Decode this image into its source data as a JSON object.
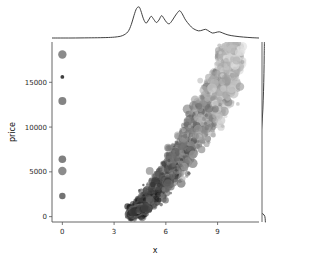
{
  "figure": {
    "type": "jointplot",
    "background": "#ffffff",
    "width": 312,
    "height": 264
  },
  "axes": {
    "x": {
      "label": "x",
      "ticks": [
        0,
        3,
        6,
        9
      ],
      "tick_labels": [
        "0",
        "3",
        "6",
        "9"
      ],
      "range": [
        -0.6,
        11.4
      ]
    },
    "y": {
      "label": "price",
      "ticks": [
        0,
        5000,
        10000,
        15000
      ],
      "tick_labels": [
        "0",
        "5000",
        "10000",
        "15000"
      ],
      "range": [
        -600,
        19500
      ]
    }
  },
  "chart_data": {
    "type": "scatter",
    "title": "",
    "xlabel": "x",
    "ylabel": "price",
    "xlim": [
      -0.6,
      11.4
    ],
    "ylim": [
      -600,
      19500
    ],
    "grid": false,
    "legend": null,
    "marker_encoding": {
      "size_varies": true,
      "color_varies": true,
      "colormap": "grayscale",
      "note": "marker grayscale ranges dark (#1a1a1a) to light (#d9d9d9); marker radius 1 to 5 px"
    },
    "outlier_points_at_x0": {
      "x": [
        0,
        0,
        0,
        0,
        0,
        0
      ],
      "y": [
        18100,
        15600,
        12900,
        6400,
        5100,
        2300
      ],
      "sizes": [
        4.2,
        1.9,
        4.0,
        3.8,
        4.2,
        3.2
      ],
      "colors": [
        "#777777",
        "#1f1f1f",
        "#6e6e6e",
        "#6a6a6a",
        "#787878",
        "#5a5a5a"
      ]
    },
    "main_cloud": {
      "description": "dense curved band rising from (x~4.0, price~400) to (x~10.3, price~18800)",
      "x_range": [
        3.6,
        10.6
      ],
      "y_range": [
        300,
        19000
      ],
      "n_points_approx": 2600,
      "trend": "monotonic increasing, convex; spread widens with x"
    },
    "marginal_top": {
      "type": "line",
      "orientation": "horizontal-kde",
      "xlabel": "x",
      "x": [
        -0.6,
        0.5,
        1.5,
        2.2,
        2.8,
        3.2,
        3.5,
        3.8,
        4.0,
        4.15,
        4.3,
        4.45,
        4.55,
        4.7,
        4.85,
        5.0,
        5.15,
        5.3,
        5.45,
        5.6,
        5.75,
        5.9,
        6.05,
        6.2,
        6.35,
        6.5,
        6.65,
        6.8,
        6.95,
        7.1,
        7.25,
        7.4,
        7.55,
        7.7,
        7.9,
        8.1,
        8.3,
        8.5,
        8.7,
        8.9,
        9.1,
        9.3,
        9.6,
        10.0,
        10.5,
        11.0,
        11.4
      ],
      "density": [
        0.0,
        0.0,
        0.005,
        0.01,
        0.02,
        0.04,
        0.08,
        0.2,
        0.44,
        0.72,
        0.95,
        1.0,
        0.88,
        0.62,
        0.48,
        0.58,
        0.7,
        0.6,
        0.5,
        0.58,
        0.72,
        0.62,
        0.5,
        0.46,
        0.55,
        0.68,
        0.8,
        0.88,
        0.78,
        0.62,
        0.5,
        0.4,
        0.32,
        0.27,
        0.23,
        0.25,
        0.28,
        0.22,
        0.16,
        0.18,
        0.2,
        0.16,
        0.1,
        0.06,
        0.03,
        0.01,
        0.0
      ]
    },
    "marginal_right": {
      "type": "line",
      "orientation": "vertical-kde",
      "ylabel": "price",
      "y": [
        -600,
        200,
        600,
        900,
        1100,
        1300,
        1500,
        1700,
        1900,
        2200,
        2600,
        3000,
        3400,
        3800,
        4200,
        4700,
        5200,
        5700,
        6200,
        6800,
        7500,
        8200,
        9000,
        10000,
        11000,
        12000,
        13000,
        14000,
        15000,
        16000,
        17000,
        18000,
        19000,
        19500
      ],
      "density": [
        0.02,
        0.06,
        0.3,
        0.62,
        0.88,
        1.0,
        0.92,
        0.7,
        0.52,
        0.4,
        0.36,
        0.4,
        0.44,
        0.4,
        0.34,
        0.3,
        0.3,
        0.28,
        0.25,
        0.22,
        0.19,
        0.17,
        0.15,
        0.13,
        0.11,
        0.095,
        0.085,
        0.075,
        0.068,
        0.062,
        0.058,
        0.055,
        0.05,
        0.048
      ]
    }
  },
  "colors": {
    "marker_dark": "#1a1a1a",
    "marker_mid": "#8a8a8a",
    "marker_light": "#d9d9d9",
    "kde_line": "#2a2a2a",
    "spine": "#555555",
    "text": "#1a1a1a"
  }
}
